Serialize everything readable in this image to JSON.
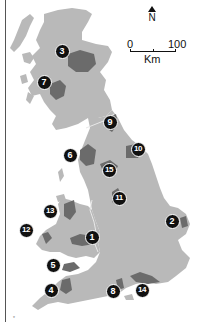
{
  "map": {
    "title": "National Parks of Great Britain",
    "colors": {
      "land": "#b9b9b9",
      "park": "#6b6b6b",
      "marker": "#111111",
      "border": "#e8e8e8",
      "background": "#ffffff"
    },
    "compass": {
      "label": "N"
    },
    "scale": {
      "start": "0",
      "end": "100",
      "unit": "Km"
    },
    "markers": [
      {
        "id": "1",
        "label": "1",
        "x": 92,
        "y": 237
      },
      {
        "id": "2",
        "label": "2",
        "x": 172,
        "y": 221
      },
      {
        "id": "3",
        "label": "3",
        "x": 62,
        "y": 51
      },
      {
        "id": "4",
        "label": "4",
        "x": 51,
        "y": 290
      },
      {
        "id": "5",
        "label": "5",
        "x": 53,
        "y": 265
      },
      {
        "id": "6",
        "label": "6",
        "x": 70,
        "y": 155
      },
      {
        "id": "7",
        "label": "7",
        "x": 44,
        "y": 82
      },
      {
        "id": "8",
        "label": "8",
        "x": 113,
        "y": 291
      },
      {
        "id": "9",
        "label": "9",
        "x": 110,
        "y": 122
      },
      {
        "id": "10",
        "label": "10",
        "x": 138,
        "y": 149
      },
      {
        "id": "11",
        "label": "11",
        "x": 119,
        "y": 198
      },
      {
        "id": "12",
        "label": "12",
        "x": 26,
        "y": 230
      },
      {
        "id": "13",
        "label": "13",
        "x": 50,
        "y": 211
      },
      {
        "id": "14",
        "label": "14",
        "x": 142,
        "y": 290
      },
      {
        "id": "15",
        "label": "15",
        "x": 109,
        "y": 170
      }
    ],
    "footnote": "*"
  }
}
